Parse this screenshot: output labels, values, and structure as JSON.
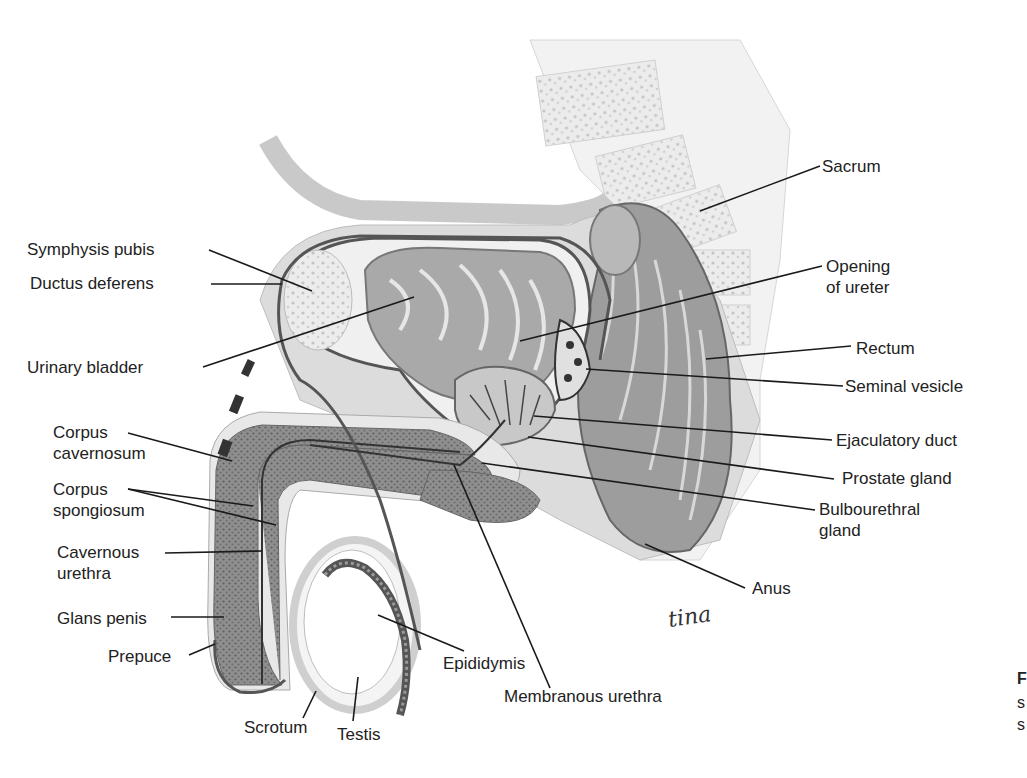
{
  "figure": {
    "labels": [
      {
        "id": "sacrum",
        "lines": [
          "Sacrum"
        ],
        "x": 822,
        "y": 172,
        "anchor": "start",
        "leader": [
          [
            820,
            166
          ],
          [
            700,
            211
          ]
        ]
      },
      {
        "id": "symphysis-pubis",
        "lines": [
          "Symphysis pubis"
        ],
        "x": 27,
        "y": 255,
        "anchor": "start",
        "leader": [
          [
            209,
            250
          ],
          [
            312,
            291
          ]
        ]
      },
      {
        "id": "opening-of-ureter",
        "lines": [
          "Opening",
          "of ureter"
        ],
        "x": 826,
        "y": 272,
        "anchor": "start",
        "leader": [
          [
            822,
            266
          ],
          [
            520,
            341
          ]
        ]
      },
      {
        "id": "ductus-deferens",
        "lines": [
          "Ductus deferens"
        ],
        "x": 30,
        "y": 289,
        "anchor": "start",
        "leader": [
          [
            211,
            284
          ],
          [
            282,
            284
          ]
        ]
      },
      {
        "id": "urinary-bladder",
        "lines": [
          "Urinary bladder"
        ],
        "x": 27,
        "y": 373,
        "anchor": "start",
        "leader": [
          [
            203,
            367
          ],
          [
            414,
            297
          ]
        ]
      },
      {
        "id": "rectum",
        "lines": [
          "Rectum"
        ],
        "x": 856,
        "y": 354,
        "anchor": "start",
        "leader": [
          [
            851,
            346
          ],
          [
            706,
            359
          ]
        ]
      },
      {
        "id": "seminal-vesicle",
        "lines": [
          "Seminal vesicle"
        ],
        "x": 845,
        "y": 392,
        "anchor": "start",
        "leader": [
          [
            843,
            386
          ],
          [
            586,
            369
          ]
        ]
      },
      {
        "id": "corpus-cavernosum",
        "lines": [
          "Corpus",
          "cavernosum"
        ],
        "x": 53,
        "y": 438,
        "anchor": "start",
        "leader": [
          [
            128,
            433
          ],
          [
            232,
            461
          ]
        ]
      },
      {
        "id": "ejaculatory-duct",
        "lines": [
          "Ejaculatory duct"
        ],
        "x": 836,
        "y": 446,
        "anchor": "start",
        "leader": [
          [
            832,
            440
          ],
          [
            534,
            416
          ]
        ]
      },
      {
        "id": "corpus-spongiosum",
        "lines": [
          "Corpus",
          "spongiosum"
        ],
        "x": 53,
        "y": 495,
        "anchor": "start",
        "leader": [
          [
            128,
            489
          ],
          [
            253,
            506
          ]
        ],
        "leader2": [
          [
            128,
            489
          ],
          [
            276,
            525
          ]
        ]
      },
      {
        "id": "prostate-gland",
        "lines": [
          "Prostate gland"
        ],
        "x": 842,
        "y": 484,
        "anchor": "start",
        "leader": [
          [
            834,
            479
          ],
          [
            528,
            437
          ]
        ]
      },
      {
        "id": "bulbourethral-gland",
        "lines": [
          "Bulbourethral",
          "gland"
        ],
        "x": 819,
        "y": 515,
        "anchor": "start",
        "leader": [
          [
            815,
            510
          ],
          [
            482,
            463
          ]
        ]
      },
      {
        "id": "cavernous-urethra",
        "lines": [
          "Cavernous",
          "urethra"
        ],
        "x": 57,
        "y": 558,
        "anchor": "start",
        "leader": [
          [
            165,
            553
          ],
          [
            262,
            551
          ]
        ]
      },
      {
        "id": "anus",
        "lines": [
          "Anus"
        ],
        "x": 752,
        "y": 594,
        "anchor": "start",
        "leader": [
          [
            745,
            588
          ],
          [
            645,
            544
          ]
        ]
      },
      {
        "id": "glans-penis",
        "lines": [
          "Glans penis"
        ],
        "x": 57,
        "y": 624,
        "anchor": "start",
        "leader": [
          [
            171,
            617
          ],
          [
            224,
            617
          ]
        ]
      },
      {
        "id": "prepuce",
        "lines": [
          "Prepuce"
        ],
        "x": 108,
        "y": 662,
        "anchor": "start",
        "leader": [
          [
            189,
            655
          ],
          [
            215,
            644
          ]
        ]
      },
      {
        "id": "epididymis",
        "lines": [
          "Epididymis"
        ],
        "x": 443,
        "y": 669,
        "anchor": "start",
        "leader": [
          [
            464,
            651
          ],
          [
            378,
            615
          ]
        ]
      },
      {
        "id": "membranous-urethra",
        "lines": [
          "Membranous urethra"
        ],
        "x": 504,
        "y": 702,
        "anchor": "start",
        "leader": [
          [
            550,
            688
          ],
          [
            454,
            465
          ]
        ]
      },
      {
        "id": "scrotum",
        "lines": [
          "Scrotum"
        ],
        "x": 244,
        "y": 733,
        "anchor": "start",
        "leader": [
          [
            303,
            718
          ],
          [
            316,
            691
          ]
        ]
      },
      {
        "id": "testis",
        "lines": [
          "Testis"
        ],
        "x": 337,
        "y": 740,
        "anchor": "start",
        "leader": [
          [
            353,
            721
          ],
          [
            358,
            677
          ]
        ]
      }
    ]
  },
  "caption": {
    "fragments": [
      "F",
      "s",
      "s"
    ]
  },
  "signature": "tina"
}
